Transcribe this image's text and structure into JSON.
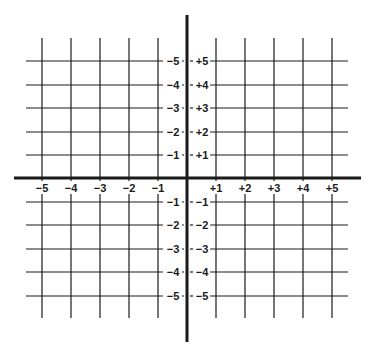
{
  "diagram": {
    "type": "cartesian-coordinate-grid",
    "colors": {
      "line": "#1a1a1a",
      "background": "#ffffff"
    },
    "x_axis": {
      "negative_labels": [
        "−5",
        "−4",
        "−3",
        "−2",
        "−1"
      ],
      "positive_labels": [
        "+1",
        "+2",
        "+3",
        "+4",
        "+5"
      ]
    },
    "y_axis": {
      "upper_left_labels": [
        "−5",
        "−4",
        "−3",
        "−2",
        "−1"
      ],
      "upper_right_labels": [
        "+5",
        "+4",
        "+3",
        "+2",
        "+1"
      ],
      "lower_left_labels": [
        "−1",
        "−2",
        "−3",
        "−4",
        "−5"
      ],
      "lower_right_labels": [
        "−1",
        "−2",
        "−3",
        "−4",
        "−5"
      ]
    }
  }
}
